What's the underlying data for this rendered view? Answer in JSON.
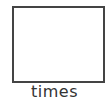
{
  "tile": {
    "label": "times",
    "box_border_color": "#444444"
  }
}
